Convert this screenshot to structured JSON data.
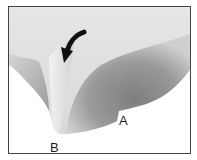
{
  "figure": {
    "labels": [
      {
        "id": "A",
        "text": "A"
      },
      {
        "id": "B",
        "text": "B"
      }
    ],
    "arrow": {
      "icon": "curved-arrow-icon",
      "direction": "down-left",
      "color": "#111111"
    },
    "colors": {
      "border": "#444444",
      "background": "#ffffff",
      "specimen_light": "#eaeaea",
      "specimen_mid": "#bdbdbd",
      "specimen_dark": "#8a8a8a"
    }
  }
}
